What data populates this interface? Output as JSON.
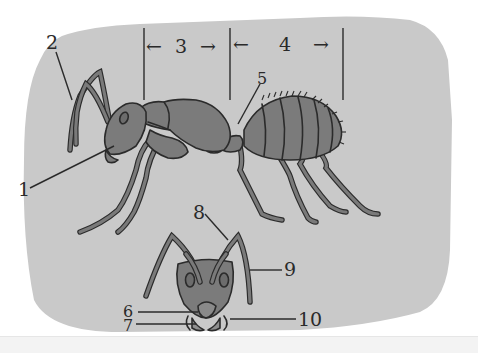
{
  "diagram": {
    "background_color": "#c9c9c9",
    "body_color": "#7b7b7b",
    "line_color": "#2b2b2b",
    "labels": [
      {
        "id": "1",
        "text": "1",
        "points_to": "head (side view)"
      },
      {
        "id": "2",
        "text": "2",
        "points_to": "antennae (side view)"
      },
      {
        "id": "3",
        "text": "3",
        "points_to": "thorax segment span"
      },
      {
        "id": "4",
        "text": "4",
        "points_to": "abdomen segment span"
      },
      {
        "id": "5",
        "text": "5",
        "points_to": "petiole / waist"
      },
      {
        "id": "6",
        "text": "6",
        "points_to": "mouthpart (upper)"
      },
      {
        "id": "7",
        "text": "7",
        "points_to": "mouthpart (lower)"
      },
      {
        "id": "8",
        "text": "8",
        "points_to": "antenna (front view)"
      },
      {
        "id": "9",
        "text": "9",
        "points_to": "antenna segment (front view)"
      },
      {
        "id": "10",
        "text": "10",
        "points_to": "mandible"
      }
    ],
    "span_arrows": {
      "section3": {
        "left_arrow": "←",
        "label": "3",
        "right_arrow": "→"
      },
      "section4": {
        "left_arrow": "←",
        "label": "4",
        "right_arrow": "→"
      }
    }
  }
}
